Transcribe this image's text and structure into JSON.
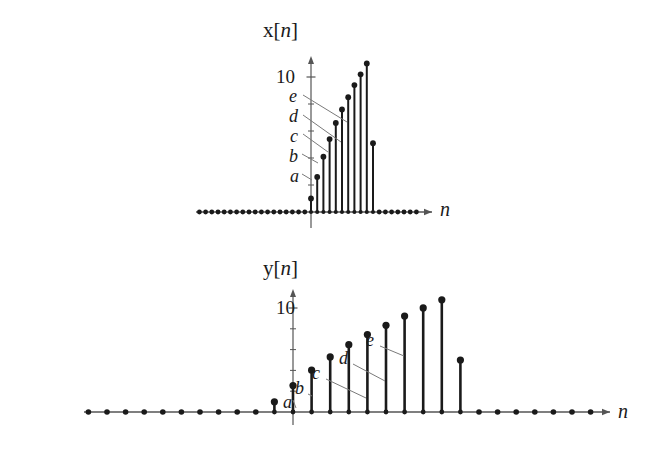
{
  "figure": {
    "background": "#ffffff",
    "ink_color": "#1a1a1a",
    "axis_color": "#555555"
  },
  "plots": [
    {
      "id": "x-plot",
      "title_prefix": "x",
      "title_bracket_open": "[",
      "title_var": "n",
      "title_bracket_close": "]",
      "title_full": "x[n]",
      "y_tick_label": "10",
      "x_axis_label": "n",
      "point_labels": [
        "a",
        "b",
        "c",
        "d",
        "e"
      ]
    },
    {
      "id": "y-plot",
      "title_prefix": "y",
      "title_bracket_open": "[",
      "title_var": "n",
      "title_bracket_close": "]",
      "title_full": "y[n]",
      "y_tick_label": "10",
      "x_axis_label": "n",
      "point_labels": [
        "a",
        "b",
        "c",
        "d",
        "e"
      ]
    }
  ],
  "chart_data": [
    {
      "type": "stem",
      "id": "x-plot",
      "title": "x[n]",
      "xlabel": "n",
      "ylabel": "x[n]",
      "ylim": [
        0,
        12
      ],
      "yticks": [
        10
      ],
      "ytick_labels": [
        "10"
      ],
      "grid": false,
      "legend": "none",
      "annotations": [
        {
          "label": "a",
          "n": 0,
          "value": 1
        },
        {
          "label": "b",
          "n": 1,
          "value": 2.6
        },
        {
          "label": "c",
          "n": 2,
          "value": 4.1
        },
        {
          "label": "d",
          "n": 3,
          "value": 5.4
        },
        {
          "label": "e",
          "n": 4,
          "value": 6.6
        }
      ],
      "x": [
        -19,
        -18,
        -17,
        -16,
        -15,
        -14,
        -13,
        -12,
        -11,
        -10,
        -9,
        -8,
        -7,
        -6,
        -5,
        -4,
        -3,
        -2,
        -1,
        0,
        1,
        2,
        3,
        4,
        5,
        6,
        7,
        8,
        9,
        10,
        11,
        12,
        13,
        14,
        15,
        16,
        17
      ],
      "values": [
        0,
        0,
        0,
        0,
        0,
        0,
        0,
        0,
        0,
        0,
        0,
        0,
        0,
        0,
        0,
        0,
        0,
        0,
        0,
        1,
        2.6,
        4.1,
        5.4,
        6.6,
        7.6,
        8.5,
        9.4,
        10.2,
        11,
        5.1,
        0,
        0,
        0,
        0,
        0,
        0,
        0
      ]
    },
    {
      "type": "stem",
      "id": "y-plot",
      "title": "y[n]",
      "xlabel": "n",
      "ylabel": "y[n]",
      "ylim": [
        0,
        12
      ],
      "yticks": [
        10
      ],
      "ytick_labels": [
        "10"
      ],
      "grid": false,
      "legend": "none",
      "annotations": [
        {
          "label": "a",
          "n": 0,
          "value": 2.6
        },
        {
          "label": "b",
          "n": 1,
          "value": 4.1
        },
        {
          "label": "c",
          "n": 2,
          "value": 5.4
        },
        {
          "label": "d",
          "n": 3,
          "value": 6.6
        },
        {
          "label": "e",
          "n": 4,
          "value": 7.6
        }
      ],
      "x": [
        -29,
        -28,
        -27,
        -26,
        -25,
        -24,
        -23,
        -22,
        -21,
        -20,
        -19,
        -18,
        -17,
        -16,
        -15,
        -14,
        -13,
        -12,
        -11,
        -10,
        -9,
        -8,
        -7,
        -6,
        -5,
        -4,
        -3,
        -2,
        -1,
        0,
        1,
        2,
        3,
        4,
        5,
        6,
        7,
        8,
        9,
        10,
        11,
        12,
        13,
        14,
        15,
        16,
        17,
        18,
        19,
        20,
        21,
        22
      ],
      "values": [
        0,
        0,
        0,
        0,
        0,
        0,
        0,
        0,
        0,
        0,
        0,
        0,
        0,
        0,
        0,
        0,
        0,
        0,
        0,
        0,
        0,
        0,
        0,
        0,
        0,
        0,
        0,
        0,
        1,
        2.6,
        4.1,
        5.4,
        6.6,
        7.6,
        8.5,
        9.4,
        10.2,
        11,
        5.1,
        0,
        0,
        0,
        0,
        0,
        0,
        0,
        0,
        0,
        0,
        0,
        0,
        0
      ]
    }
  ]
}
